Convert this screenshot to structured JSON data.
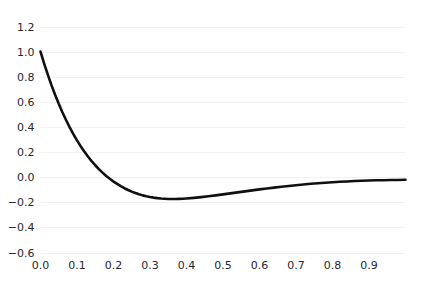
{
  "chart_data": {
    "type": "line",
    "title": "",
    "subtitle": "",
    "xlabel": "",
    "ylabel": "",
    "grid": true,
    "grid_axis": "y",
    "legend": false,
    "legend_position": "none",
    "xlim": [
      0.0,
      1.0
    ],
    "ylim": [
      -0.6,
      1.2
    ],
    "xticks": [
      0.0,
      0.1,
      0.2,
      0.3,
      0.4,
      0.5,
      0.6,
      0.7,
      0.8,
      0.9
    ],
    "xtick_labels": [
      "0.0",
      "0.1",
      "0.2",
      "0.3",
      "0.4",
      "0.5",
      "0.6",
      "0.7",
      "0.8",
      "0.9"
    ],
    "yticks": [
      -0.6,
      -0.4,
      -0.2,
      0.0,
      0.2,
      0.4,
      0.6,
      0.8,
      1.0,
      1.2
    ],
    "ytick_labels": [
      "−0.6",
      "−0.4",
      "−0.2",
      "0.0",
      "0.2",
      "0.4",
      "0.6",
      "0.8",
      "1.0",
      "1.2"
    ],
    "series": [
      {
        "name": "curve",
        "color": "#101010",
        "linewidth": 2.6,
        "x": [
          0.0,
          0.01,
          0.02,
          0.03,
          0.04,
          0.05,
          0.06,
          0.07,
          0.08,
          0.09,
          0.1,
          0.11,
          0.12,
          0.13,
          0.14,
          0.15,
          0.16,
          0.17,
          0.18,
          0.19,
          0.2,
          0.21,
          0.22,
          0.23,
          0.24,
          0.25,
          0.26,
          0.27,
          0.28,
          0.29,
          0.3,
          0.31,
          0.32,
          0.33,
          0.34,
          0.35,
          0.36,
          0.37,
          0.38,
          0.39,
          0.4,
          0.42,
          0.44,
          0.46,
          0.48,
          0.5,
          0.52,
          0.54,
          0.56,
          0.58,
          0.6,
          0.62,
          0.64,
          0.66,
          0.68,
          0.7,
          0.72,
          0.74,
          0.76,
          0.78,
          0.8,
          0.82,
          0.84,
          0.86,
          0.88,
          0.9,
          0.92,
          0.94,
          0.96,
          0.98,
          1.0
        ],
        "y": [
          1.0,
          0.905,
          0.816,
          0.733,
          0.656,
          0.584,
          0.517,
          0.455,
          0.397,
          0.343,
          0.293,
          0.247,
          0.204,
          0.165,
          0.128,
          0.095,
          0.064,
          0.036,
          0.01,
          -0.013,
          -0.035,
          -0.054,
          -0.072,
          -0.088,
          -0.102,
          -0.115,
          -0.126,
          -0.136,
          -0.145,
          -0.152,
          -0.158,
          -0.163,
          -0.167,
          -0.17,
          -0.172,
          -0.174,
          -0.174,
          -0.174,
          -0.173,
          -0.172,
          -0.17,
          -0.165,
          -0.159,
          -0.152,
          -0.145,
          -0.137,
          -0.129,
          -0.121,
          -0.113,
          -0.105,
          -0.097,
          -0.09,
          -0.083,
          -0.076,
          -0.07,
          -0.064,
          -0.058,
          -0.053,
          -0.048,
          -0.044,
          -0.04,
          -0.037,
          -0.034,
          -0.031,
          -0.029,
          -0.027,
          -0.025,
          -0.024,
          -0.023,
          -0.022,
          -0.021
        ]
      }
    ],
    "annotations": [],
    "minimum": {
      "x": 0.3,
      "y": -0.38
    },
    "start_point": {
      "x": 0.0,
      "y": 1.0
    },
    "end_point": {
      "x": 1.0,
      "y": -0.09
    }
  },
  "style": {
    "background": "#ffffff",
    "grid_color": "#f2f2f4",
    "tick_label_color": "#26282b",
    "line_color": "#101010"
  }
}
